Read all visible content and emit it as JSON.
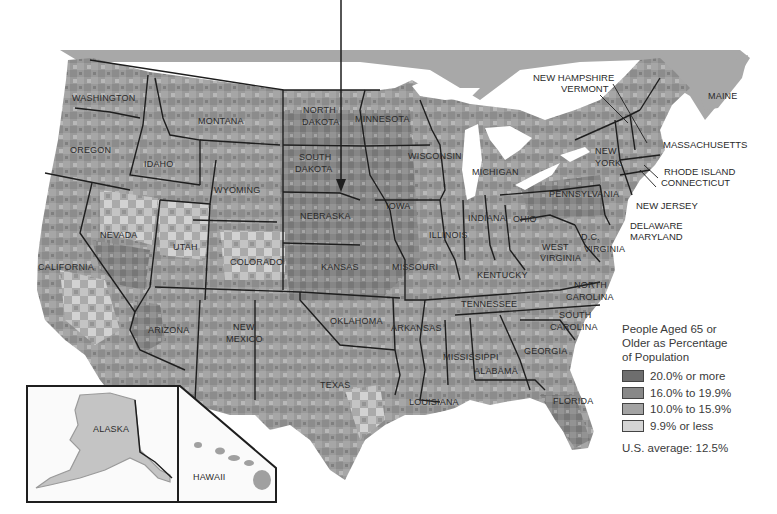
{
  "map": {
    "type": "choropleth",
    "subject": "United States by county",
    "colors": {
      "background": "#ffffff",
      "canada": "#a8a8a8",
      "water": "#ffffff",
      "border": "#1e1e1e",
      "bin_20_plus": "#6e6e6e",
      "bin_16_19": "#888888",
      "bin_10_15": "#a3a3a3",
      "bin_under_10": "#d4d4d4"
    },
    "states": [
      {
        "name": "WASHINGTON",
        "x": 72,
        "y": 101
      },
      {
        "name": "OREGON",
        "x": 70,
        "y": 153
      },
      {
        "name": "IDAHO",
        "x": 144,
        "y": 167
      },
      {
        "name": "MONTANA",
        "x": 198,
        "y": 124
      },
      {
        "name": "WYOMING",
        "x": 214,
        "y": 193
      },
      {
        "name": "NORTH",
        "x": 303,
        "y": 113
      },
      {
        "name": "DAKOTA",
        "x": 302,
        "y": 125
      },
      {
        "name": "SOUTH",
        "x": 299,
        "y": 160
      },
      {
        "name": "DAKOTA",
        "x": 295,
        "y": 172
      },
      {
        "name": "MINNESOTA",
        "x": 355,
        "y": 122
      },
      {
        "name": "WISCONSIN",
        "x": 408,
        "y": 159
      },
      {
        "name": "MICHIGAN",
        "x": 472,
        "y": 175
      },
      {
        "name": "NEVADA",
        "x": 100,
        "y": 238
      },
      {
        "name": "UTAH",
        "x": 173,
        "y": 250
      },
      {
        "name": "CALIFORNIA",
        "x": 38,
        "y": 270
      },
      {
        "name": "COLORADO",
        "x": 230,
        "y": 265
      },
      {
        "name": "NEBRASKA",
        "x": 300,
        "y": 219
      },
      {
        "name": "IOWA",
        "x": 386,
        "y": 209
      },
      {
        "name": "ILLINOIS",
        "x": 429,
        "y": 238
      },
      {
        "name": "INDIANA",
        "x": 468,
        "y": 221
      },
      {
        "name": "OHIO",
        "x": 513,
        "y": 222
      },
      {
        "name": "KANSAS",
        "x": 321,
        "y": 270
      },
      {
        "name": "MISSOURI",
        "x": 392,
        "y": 270
      },
      {
        "name": "KENTUCKY",
        "x": 477,
        "y": 278
      },
      {
        "name": "WEST",
        "x": 542,
        "y": 250
      },
      {
        "name": "VIRGINIA",
        "x": 540,
        "y": 261
      },
      {
        "name": "D.C.",
        "x": 581,
        "y": 240
      },
      {
        "name": "VIRGINIA",
        "x": 584,
        "y": 252
      },
      {
        "name": "PENNSYLVANIA",
        "x": 549,
        "y": 197
      },
      {
        "name": "NEW",
        "x": 595,
        "y": 154
      },
      {
        "name": "YORK",
        "x": 595,
        "y": 166
      },
      {
        "name": "MAINE",
        "x": 708,
        "y": 99
      },
      {
        "name": "ARIZONA",
        "x": 148,
        "y": 333
      },
      {
        "name": "NEW",
        "x": 233,
        "y": 330
      },
      {
        "name": "MEXICO",
        "x": 226,
        "y": 342
      },
      {
        "name": "OKLAHOMA",
        "x": 330,
        "y": 324
      },
      {
        "name": "ARKANSAS",
        "x": 391,
        "y": 331
      },
      {
        "name": "TENNESSEE",
        "x": 461,
        "y": 307
      },
      {
        "name": "NORTH",
        "x": 574,
        "y": 288
      },
      {
        "name": "CAROLINA",
        "x": 566,
        "y": 300
      },
      {
        "name": "SOUTH",
        "x": 559,
        "y": 318
      },
      {
        "name": "CAROLINA",
        "x": 550,
        "y": 330
      },
      {
        "name": "GEORGIA",
        "x": 524,
        "y": 354
      },
      {
        "name": "MISSISSIPPI",
        "x": 443,
        "y": 360
      },
      {
        "name": "ALABAMA",
        "x": 474,
        "y": 374
      },
      {
        "name": "TEXAS",
        "x": 320,
        "y": 388
      },
      {
        "name": "LOUISIANA",
        "x": 409,
        "y": 405
      },
      {
        "name": "FLORIDA",
        "x": 553,
        "y": 404
      },
      {
        "name": "ALASKA",
        "x": 93,
        "y": 432
      },
      {
        "name": "HAWAII",
        "x": 193,
        "y": 480
      }
    ],
    "callouts": [
      {
        "name": "NEW HAMPSHIRE",
        "x": 533,
        "y": 81
      },
      {
        "name": "VERMONT",
        "x": 561,
        "y": 92
      },
      {
        "name": "MASSACHUSETTS",
        "x": 663,
        "y": 148
      },
      {
        "name": "RHODE ISLAND",
        "x": 664,
        "y": 175
      },
      {
        "name": "CONNECTICUT",
        "x": 661,
        "y": 186
      },
      {
        "name": "NEW JERSEY",
        "x": 636,
        "y": 209
      },
      {
        "name": "DELAWARE",
        "x": 630,
        "y": 229
      },
      {
        "name": "MARYLAND",
        "x": 630,
        "y": 240
      }
    ],
    "insets": [
      "ALASKA",
      "HAWAII"
    ],
    "arrow": {
      "x": 341,
      "y_start": 0,
      "y_end": 192,
      "target": "NEBRASKA"
    }
  },
  "legend": {
    "title_lines": [
      "People Aged 65 or",
      "Older as Percentage",
      "of Population"
    ],
    "items": [
      {
        "label": "20.0% or more",
        "color": "#6e6e6e"
      },
      {
        "label": "16.0% to 19.9%",
        "color": "#888888"
      },
      {
        "label": "10.0% to 15.9%",
        "color": "#a3a3a3"
      },
      {
        "label": "9.9% or less",
        "color": "#d4d4d4"
      }
    ],
    "average": "U.S. average: 12.5%"
  }
}
